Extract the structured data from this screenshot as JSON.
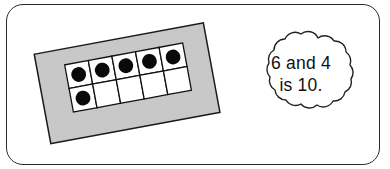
{
  "figure": {
    "kind": "ten-frame-math-illustration",
    "frame_border_color": "#2b2b2b",
    "background_color": "#ffffff"
  },
  "ten_frame_card": {
    "name": "ten-frame-card",
    "card_color": "#c9c9c9",
    "card_outline_color": "#1a1a1a",
    "rotation_degrees": -10.5,
    "rows": 2,
    "columns": 5,
    "cell_fill_color": "#ffffff",
    "cell_border_color": "#111111",
    "counter_color": "#0a0a0a",
    "filled_count": 6,
    "empty_count": 4,
    "cells": [
      [
        {
          "index": 1,
          "filled": true
        },
        {
          "index": 2,
          "filled": true
        },
        {
          "index": 3,
          "filled": true
        },
        {
          "index": 4,
          "filled": true
        },
        {
          "index": 5,
          "filled": true
        }
      ],
      [
        {
          "index": 6,
          "filled": true
        },
        {
          "index": 7,
          "filled": false
        },
        {
          "index": 8,
          "filled": false
        },
        {
          "index": 9,
          "filled": false
        },
        {
          "index": 10,
          "filled": false
        }
      ]
    ]
  },
  "speech_bubble": {
    "name": "speech-bubble",
    "shape": "cloud-scalloped",
    "fill_color": "#ffffff",
    "outline_color": "#222222",
    "line_1": "6 and 4",
    "line_2": "is 10."
  }
}
